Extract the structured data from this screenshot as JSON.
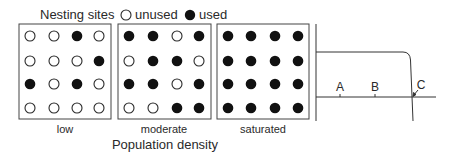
{
  "legend": {
    "title": "Nesting sites",
    "unused_label": "unused",
    "used_label": "used"
  },
  "panels": [
    {
      "label": "low",
      "grid": [
        [
          0,
          0,
          1,
          0
        ],
        [
          0,
          0,
          0,
          1
        ],
        [
          1,
          0,
          1,
          0
        ],
        [
          0,
          0,
          0,
          0
        ]
      ]
    },
    {
      "label": "moderate",
      "grid": [
        [
          1,
          1,
          0,
          1
        ],
        [
          0,
          1,
          1,
          0
        ],
        [
          1,
          1,
          0,
          1
        ],
        [
          0,
          0,
          1,
          1
        ]
      ]
    },
    {
      "label": "saturated",
      "grid": [
        [
          1,
          1,
          1,
          1
        ],
        [
          1,
          1,
          1,
          1
        ],
        [
          1,
          1,
          1,
          1
        ],
        [
          1,
          1,
          1,
          1
        ]
      ]
    }
  ],
  "axis_label": "Population density",
  "graph": {
    "points": [
      {
        "label": "A"
      },
      {
        "label": "B"
      },
      {
        "label": "C"
      }
    ]
  },
  "colors": {
    "ink": "#2a2a2a",
    "background": "#ffffff"
  }
}
